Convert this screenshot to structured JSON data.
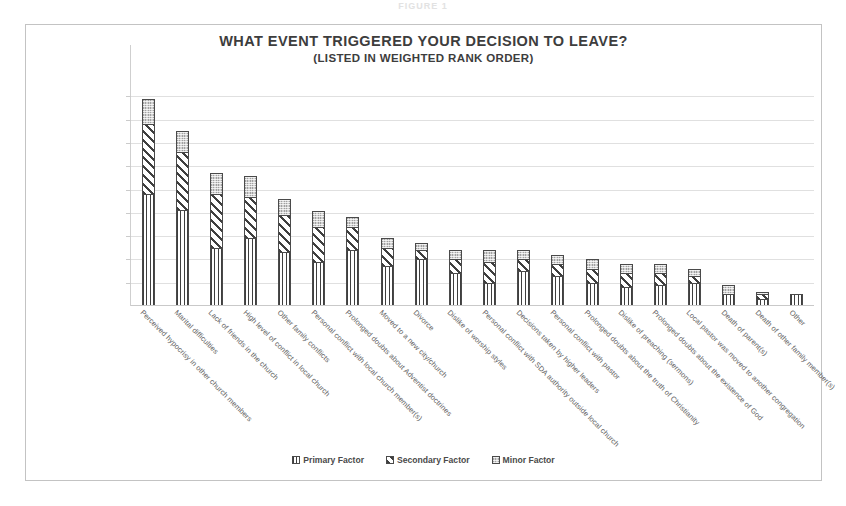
{
  "figure": {
    "caption": "FIGURE 1"
  },
  "chart_data": {
    "type": "bar",
    "stacked": true,
    "title": "WHAT EVENT TRIGGERED YOUR DECISION TO LEAVE?",
    "subtitle": "(LISTED IN WEIGHTED RANK ORDER)",
    "xlabel": "",
    "ylabel": "",
    "ylim": [
      0,
      100
    ],
    "grid": true,
    "gridlines": [
      10,
      20,
      30,
      40,
      50,
      60,
      70,
      80,
      90
    ],
    "legend_position": "bottom",
    "legend": [
      {
        "name": "Primary Factor",
        "pattern": "vertical-lines",
        "color": "#3f3f3f"
      },
      {
        "name": "Secondary Factor",
        "pattern": "diagonal-stripes",
        "color": "#3f3f3f"
      },
      {
        "name": "Minor Factor",
        "pattern": "light-dotted",
        "color": "#d2d2d2"
      }
    ],
    "categories": [
      "Perceived hypocrisy in other church members",
      "Marital difficulties",
      "Lack of friends in the church",
      "High level of conflict in local church",
      "Other family conflicts",
      "Personal conflict with local church member(s)",
      "Prolonged doubts about Adventist doctrines",
      "Moved to a new city/church",
      "Divorce",
      "Dislike of worship styles",
      "Personal conflict with SDA authority outside local church",
      "Decisions taken by higher leaders",
      "Personal conflict with pastor",
      "Prolonged doubts about the truth of Christianity",
      "Dislike of preaching (sermons)",
      "Prolonged doubts about the existence of God",
      "Local pastor was moved to another congregation",
      "Death of parent(s)",
      "Death of other family member(s)",
      "Other"
    ],
    "series": [
      {
        "name": "Primary Factor",
        "values": [
          48,
          41,
          25,
          29,
          23,
          19,
          24,
          17,
          20,
          14,
          10,
          15,
          13,
          10,
          8,
          9,
          10,
          5,
          3,
          5
        ]
      },
      {
        "name": "Secondary Factor",
        "values": [
          30,
          25,
          23,
          18,
          16,
          15,
          10,
          8,
          4,
          6,
          9,
          5,
          5,
          6,
          6,
          5,
          3,
          0,
          2,
          0
        ]
      },
      {
        "name": "Minor Factor",
        "values": [
          11,
          9,
          9,
          9,
          7,
          7,
          4,
          4,
          3,
          4,
          5,
          4,
          4,
          4,
          4,
          4,
          3,
          4,
          1,
          0
        ]
      }
    ],
    "totals": [
      89,
      75,
      57,
      56,
      46,
      41,
      38,
      29,
      27,
      24,
      24,
      24,
      22,
      20,
      18,
      18,
      16,
      9,
      6,
      5
    ]
  }
}
